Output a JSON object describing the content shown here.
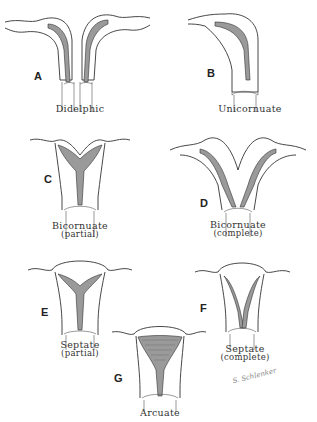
{
  "figure": {
    "colors": {
      "line": "#333333",
      "cavity_shading": "#9a9a9a",
      "background": "#ffffff"
    },
    "panels": [
      {
        "id": "A",
        "letter": "A",
        "caption": "Didelphic",
        "subcaption": ""
      },
      {
        "id": "B",
        "letter": "B",
        "caption": "Unicornuate",
        "subcaption": ""
      },
      {
        "id": "C",
        "letter": "C",
        "caption": "Bicornuate",
        "subcaption": "(partial)"
      },
      {
        "id": "D",
        "letter": "D",
        "caption": "Bicornuate",
        "subcaption": "(complete)"
      },
      {
        "id": "E",
        "letter": "E",
        "caption": "Septate",
        "subcaption": "(partial)"
      },
      {
        "id": "F",
        "letter": "F",
        "caption": "Septate",
        "subcaption": "(complete)"
      },
      {
        "id": "G",
        "letter": "G",
        "caption": "Arcuate",
        "subcaption": ""
      }
    ],
    "signature": "S. Schlenker"
  }
}
